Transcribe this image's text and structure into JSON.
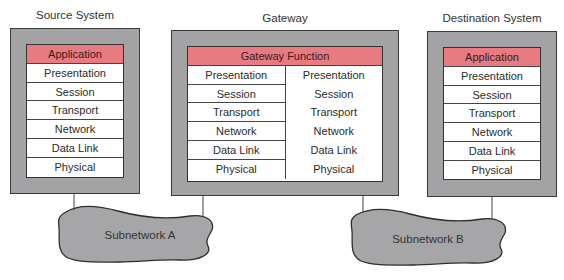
{
  "diagram": {
    "source_system": {
      "title": "Source System",
      "layers": [
        "Application",
        "Presentation",
        "Session",
        "Transport",
        "Network",
        "Data Link",
        "Physical"
      ]
    },
    "gateway": {
      "title": "Gateway",
      "function_label": "Gateway Function",
      "left_layers": [
        "Presentation",
        "Session",
        "Transport",
        "Network",
        "Data Link",
        "Physical"
      ],
      "right_layers": [
        "Presentation",
        "Session",
        "Transport",
        "Network",
        "Data Link",
        "Physical"
      ]
    },
    "destination_system": {
      "title": "Destination System",
      "layers": [
        "Application",
        "Presentation",
        "Session",
        "Transport",
        "Network",
        "Data Link",
        "Physical"
      ]
    },
    "subnetworks": [
      {
        "label": "Subnetwork A"
      },
      {
        "label": "Subnetwork B"
      }
    ],
    "colors": {
      "highlight": "#e87a82",
      "box_fill": "#a3a3a5",
      "cloud_fill": "#a6a6a8"
    }
  }
}
